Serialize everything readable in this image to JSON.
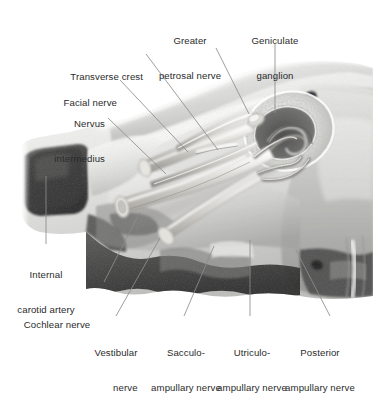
{
  "figure": {
    "medium": "grayscale anatomical photograph with line leaders",
    "background_color": "#ffffff",
    "leader_color": "#8c8c8c",
    "label_color": "#2b2b2b"
  },
  "labels": {
    "greater_petrosal_nerve": {
      "line1": "Greater",
      "line2": "petrosal nerve"
    },
    "geniculate_ganglion": {
      "line1": "Geniculate",
      "line2": "ganglion"
    },
    "transverse_crest": {
      "line1": "Transverse crest"
    },
    "facial_nerve": {
      "line1": "Facial nerve"
    },
    "nervus_intermedius": {
      "line1": "Nervus",
      "line2": "intermedius"
    },
    "internal_carotid_artery": {
      "line1": "Internal",
      "line2": "carotid artery"
    },
    "cochlear_nerve": {
      "line1": "Cochlear nerve"
    },
    "vestibular_nerve": {
      "line1": "Vestibular",
      "line2": "nerve"
    },
    "sacculo_ampullary_nerve": {
      "line1": "Sacculo-",
      "line2": "ampullary nerve"
    },
    "utriculo_ampullary_nerve": {
      "line1": "Utriculo-",
      "line2": "ampullary nerve"
    },
    "posterior_ampullary_nerve": {
      "line1": "Posterior",
      "line2": "ampullary nerve"
    }
  },
  "structures": [
    {
      "name": "greater-petrosal-nerve",
      "region": "upper canal running anteromedially"
    },
    {
      "name": "geniculate-ganglion",
      "region": "genu of facial nerve"
    },
    {
      "name": "transverse-crest",
      "region": "falciform crest in fundus"
    },
    {
      "name": "facial-nerve",
      "region": "anterosuperior nerve trunk"
    },
    {
      "name": "nervus-intermedius",
      "region": "between facial and vestibular trunks"
    },
    {
      "name": "internal-carotid-artery",
      "region": "dark petrous canal, left of field"
    },
    {
      "name": "cochlear-nerve",
      "region": "anteroinferior trunk"
    },
    {
      "name": "vestibular-nerve",
      "region": "posterior trunk"
    },
    {
      "name": "sacculo-ampullary-nerve",
      "region": "inferior vestibular branch"
    },
    {
      "name": "utriculo-ampullary-nerve",
      "region": "superior vestibular branch"
    },
    {
      "name": "posterior-ampullary-nerve",
      "region": "singular nerve, posterolateral"
    }
  ]
}
